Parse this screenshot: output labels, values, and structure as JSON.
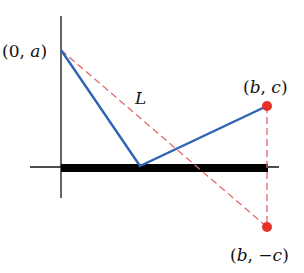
{
  "diagram": {
    "labels": {
      "point_a": "(0, a)",
      "point_a_parts": [
        "(0, ",
        "a",
        ")"
      ],
      "point_bc": "(b, c)",
      "point_bc_parts": [
        "(",
        "b",
        ", ",
        "c",
        ")"
      ],
      "point_bnegc": "(b, −c)",
      "point_bnegc_parts": [
        "(",
        "b",
        ", −",
        "c",
        ")"
      ],
      "line_L": "L"
    },
    "colors": {
      "axis": "#111111",
      "bar": "#000000",
      "path": "#2f63b5",
      "dashed": "#e06a6a",
      "point": "#e8302a"
    },
    "points": {
      "origin": [
        61,
        167
      ],
      "a": [
        61,
        50
      ],
      "reflection_point": [
        140,
        166
      ],
      "bc": [
        267,
        106
      ],
      "b_neg_c": [
        267,
        227
      ]
    }
  }
}
